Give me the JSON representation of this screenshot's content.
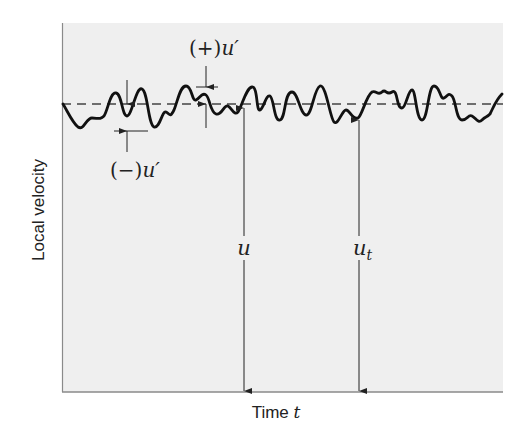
{
  "figure": {
    "type": "turbulent velocity fluctuation diagram",
    "panel_background": "#efefef",
    "line_color": "#111111",
    "axis_color": "#8a8a8a"
  },
  "axes": {
    "x_label_text": "Time ",
    "x_label_var": "t",
    "y_label": "Local velocity"
  },
  "labels": {
    "positive_fluct_prefix": "(+)",
    "positive_fluct_var": "u′",
    "negative_fluct_prefix": "(−)",
    "negative_fluct_var": "u′",
    "mean_velocity": "u",
    "instant_velocity_main": "u",
    "instant_velocity_sub": "t"
  },
  "elements": {
    "mean_line": "dashed horizontal line representing time-averaged velocity u",
    "signal": "fluctuating instantaneous velocity trace",
    "arrows": [
      "mean-velocity-arrow (u)",
      "instantaneous-velocity-arrow (u_t)",
      "positive-fluctuation-arrows",
      "negative-fluctuation-arrows"
    ]
  }
}
